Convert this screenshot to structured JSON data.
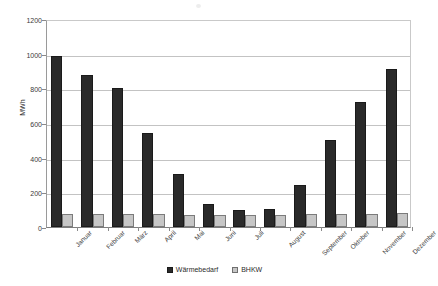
{
  "chart_data": {
    "type": "bar",
    "title": "",
    "subtitle": "",
    "xlabel": "",
    "ylabel": "MWh",
    "ylim": [
      0,
      1200
    ],
    "ytick_values": [
      0,
      200,
      400,
      600,
      800,
      1000,
      1200
    ],
    "ytick_labels": [
      "0",
      "200",
      "400",
      "600",
      "800",
      "1000",
      "1200"
    ],
    "grid": true,
    "legend_position": "bottom-center",
    "categories": [
      "Januar",
      "Februar",
      "März",
      "April",
      "Mai",
      "Juni",
      "Juli",
      "August",
      "September",
      "Oktober",
      "November",
      "Dezember"
    ],
    "series": [
      {
        "name": "Wärmebedarf",
        "color": "#2a2a2a",
        "values": [
          985,
          875,
          800,
          540,
          305,
          135,
          100,
          105,
          245,
          500,
          720,
          910
        ]
      },
      {
        "name": "BHKW",
        "color": "#c6c6c6",
        "values": [
          75,
          75,
          75,
          75,
          72,
          72,
          72,
          72,
          75,
          75,
          75,
          78
        ]
      }
    ]
  },
  "legend": {
    "entries": [
      {
        "label": "Wärmebedarf",
        "swatch": "heat"
      },
      {
        "label": "BHKW",
        "swatch": "chp"
      }
    ]
  },
  "axis": {
    "y_title": "MWh"
  }
}
